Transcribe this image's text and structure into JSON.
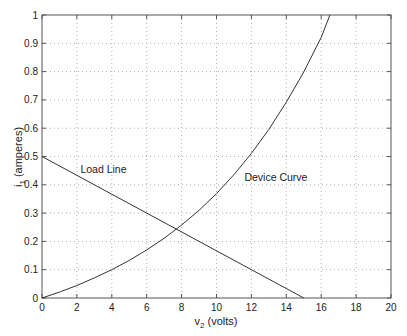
{
  "chart_data": {
    "type": "line",
    "title": "",
    "xlabel": "v2 (volts)",
    "xlabel_main": "v",
    "xlabel_sub": "2",
    "xlabel_rest": " (volts)",
    "ylabel": "i1 (amperes)",
    "ylabel_main": "i",
    "ylabel_sub": "1",
    "ylabel_rest": " (amperes)",
    "xlim": [
      0,
      20
    ],
    "ylim": [
      0,
      1
    ],
    "xticks": [
      0,
      2,
      4,
      6,
      8,
      10,
      12,
      14,
      16,
      18,
      20
    ],
    "yticks": [
      0,
      0.1,
      0.2,
      0.3,
      0.4,
      0.5,
      0.6,
      0.7,
      0.8,
      0.9,
      1
    ],
    "ytick_labels": [
      "0",
      "0.1",
      "0.2",
      "0.3",
      "0.4",
      "0.5",
      "0.6",
      "0.7",
      "0.8",
      "0.9",
      "1"
    ],
    "grid": true,
    "grid_style": "dotted",
    "series": [
      {
        "name": "Load Line",
        "x": [
          0,
          15
        ],
        "y": [
          0.5,
          0
        ]
      },
      {
        "name": "Device Curve",
        "x": [
          0,
          1,
          2,
          3,
          4,
          5,
          6,
          7,
          8,
          9,
          10,
          11,
          12,
          13,
          14,
          15,
          16,
          16.5
        ],
        "y": [
          0,
          0.021,
          0.044,
          0.071,
          0.1,
          0.133,
          0.17,
          0.211,
          0.258,
          0.31,
          0.369,
          0.436,
          0.511,
          0.596,
          0.692,
          0.799,
          0.921,
          1.0
        ]
      }
    ],
    "annotations": [
      {
        "text": "Load Line",
        "x": 2.2,
        "y": 0.44
      },
      {
        "text": "Device Curve",
        "x": 11.6,
        "y": 0.415
      }
    ],
    "line_color": "#333333",
    "grid_color": "#b0b0b0",
    "axis_color": "#555555"
  }
}
